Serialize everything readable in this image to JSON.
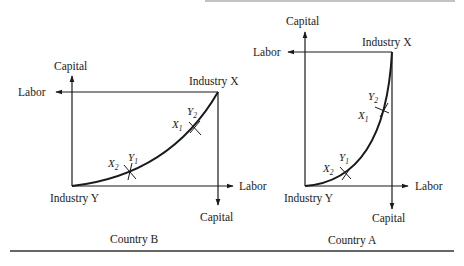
{
  "figure": {
    "top_rule_color": "#777777",
    "bottom_rule_color": "#333333",
    "ink_color": "#1a1a1a"
  },
  "country_b": {
    "caption": "Country B",
    "origin_label": "Industry Y",
    "corner_label": "Industry X",
    "axes": {
      "capital_top": "Capital",
      "labor_left": "Labor",
      "labor_right": "Labor",
      "capital_bottom": "Capital"
    },
    "points": {
      "upper": {
        "y_label": "Y",
        "y_sub": "2",
        "x_label": "X",
        "x_sub": "1"
      },
      "lower": {
        "y_label": "Y",
        "y_sub": "1",
        "x_label": "X",
        "x_sub": "2"
      }
    }
  },
  "country_a": {
    "caption": "Country A",
    "origin_label": "Industry Y",
    "corner_label": "Industry X",
    "axes": {
      "capital_top": "Capital",
      "labor_left": "Labor",
      "labor_right": "Labor",
      "capital_bottom": "Capital"
    },
    "points": {
      "upper": {
        "y_label": "Y",
        "y_sub": "2",
        "x_label": "X",
        "x_sub": "1"
      },
      "lower": {
        "y_label": "Y",
        "y_sub": "1",
        "x_label": "X",
        "x_sub": "2"
      }
    }
  }
}
